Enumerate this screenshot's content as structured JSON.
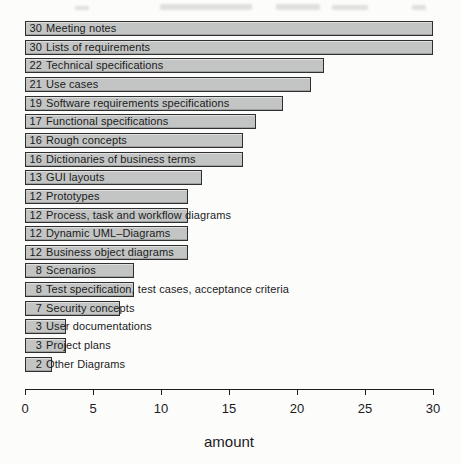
{
  "chart_data": {
    "type": "bar",
    "orientation": "horizontal",
    "title": "",
    "xlabel": "amount",
    "ylabel": "",
    "xlim": [
      0,
      30
    ],
    "x_ticks": [
      0,
      5,
      10,
      15,
      20,
      25,
      30
    ],
    "grid": false,
    "legend": false,
    "bar_label_format": "value then category, printed inside/over the bar",
    "categories": [
      "Meeting notes",
      "Lists of requirements",
      "Technical specifications",
      "Use cases",
      "Software requirements specifications",
      "Functional specifications",
      "Rough concepts",
      "Dictionaries of business terms",
      "GUI layouts",
      "Prototypes",
      "Process, task and workflow diagrams",
      "Dynamic UML–Diagrams",
      "Business object diagrams",
      "Scenarios",
      "Test specification, test cases, acceptance criteria",
      "Security concepts",
      "User documentations",
      "Project plans",
      "Other Diagrams"
    ],
    "values": [
      30,
      30,
      22,
      21,
      19,
      17,
      16,
      16,
      13,
      12,
      12,
      12,
      12,
      8,
      8,
      7,
      3,
      3,
      2
    ]
  },
  "colors": {
    "background": "#fcfcfb",
    "bar_fill": "#c3c5c4",
    "bar_border": "#2f2f2f",
    "text": "#1b1b1b",
    "axis": "#1c1c1c"
  }
}
